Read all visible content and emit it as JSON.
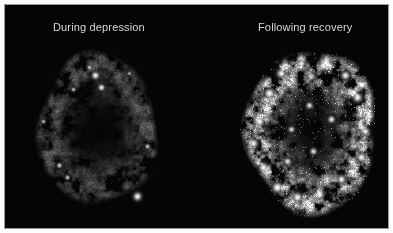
{
  "figure": {
    "type": "brain-scan-comparison",
    "modality": "functional brain scan (PET-style activity map)",
    "background_color": "#050505",
    "frame_color": "#ffffff",
    "border_color": "#9a9a9a",
    "label_color": "#d9d9d9"
  },
  "panels": [
    {
      "id": "during-depression",
      "label": "During depression",
      "label_x": 52,
      "label_y": 20,
      "brain": {
        "center_x": 96,
        "center_y": 128,
        "radius_x": 60,
        "radius_y": 76,
        "intensity": 0.34,
        "hotspot_density": 0.1,
        "seed": 1973,
        "description": "Sparse, dim cortical rim with only a few scattered bright foci; overall low activity."
      },
      "hotspots": [
        {
          "x": 94,
          "y": 74,
          "r": 3.4,
          "v": 0.95
        },
        {
          "x": 88,
          "y": 66,
          "r": 2.2,
          "v": 0.8
        },
        {
          "x": 100,
          "y": 86,
          "r": 3.0,
          "v": 0.92
        },
        {
          "x": 72,
          "y": 88,
          "r": 2.0,
          "v": 0.74
        },
        {
          "x": 136,
          "y": 195,
          "r": 3.6,
          "v": 0.98
        },
        {
          "x": 58,
          "y": 164,
          "r": 2.4,
          "v": 0.8
        },
        {
          "x": 66,
          "y": 176,
          "r": 2.2,
          "v": 0.76
        },
        {
          "x": 146,
          "y": 145,
          "r": 2.2,
          "v": 0.78
        },
        {
          "x": 42,
          "y": 120,
          "r": 2.0,
          "v": 0.7
        },
        {
          "x": 128,
          "y": 72,
          "r": 1.8,
          "v": 0.68
        }
      ]
    },
    {
      "id": "following-recovery",
      "label": "Following recovery",
      "label_x": 257,
      "label_y": 20,
      "brain": {
        "center_x": 310,
        "center_y": 130,
        "radius_x": 66,
        "radius_y": 82,
        "intensity": 1.0,
        "hotspot_density": 0.55,
        "seed": 4421,
        "description": "Dense, bright gyral pattern throughout the cortex with widespread high-uptake foci; markedly increased activity."
      },
      "hotspots": [
        {
          "x": 268,
          "y": 92,
          "r": 4.5,
          "v": 1.0
        },
        {
          "x": 280,
          "y": 72,
          "r": 4.0,
          "v": 0.96
        },
        {
          "x": 300,
          "y": 62,
          "r": 3.6,
          "v": 0.94
        },
        {
          "x": 322,
          "y": 64,
          "r": 4.2,
          "v": 0.98
        },
        {
          "x": 344,
          "y": 74,
          "r": 3.8,
          "v": 0.95
        },
        {
          "x": 356,
          "y": 96,
          "r": 4.0,
          "v": 0.97
        },
        {
          "x": 258,
          "y": 120,
          "r": 4.4,
          "v": 0.99
        },
        {
          "x": 252,
          "y": 142,
          "r": 4.0,
          "v": 0.96
        },
        {
          "x": 262,
          "y": 166,
          "r": 4.2,
          "v": 0.98
        },
        {
          "x": 276,
          "y": 186,
          "r": 4.6,
          "v": 1.0
        },
        {
          "x": 296,
          "y": 196,
          "r": 4.2,
          "v": 0.98
        },
        {
          "x": 318,
          "y": 192,
          "r": 4.0,
          "v": 0.96
        },
        {
          "x": 340,
          "y": 178,
          "r": 3.8,
          "v": 0.95
        },
        {
          "x": 360,
          "y": 156,
          "r": 4.0,
          "v": 0.97
        },
        {
          "x": 364,
          "y": 130,
          "r": 3.6,
          "v": 0.94
        },
        {
          "x": 308,
          "y": 104,
          "r": 3.0,
          "v": 0.88
        },
        {
          "x": 290,
          "y": 128,
          "r": 2.8,
          "v": 0.84
        },
        {
          "x": 330,
          "y": 118,
          "r": 3.2,
          "v": 0.9
        },
        {
          "x": 312,
          "y": 150,
          "r": 3.0,
          "v": 0.88
        },
        {
          "x": 286,
          "y": 160,
          "r": 3.2,
          "v": 0.9
        }
      ]
    }
  ],
  "chart_data": {
    "type": "heatmap",
    "title": "",
    "xlabel": "",
    "ylabel": "",
    "legend": [
      "During depression",
      "Following recovery"
    ],
    "categories": [
      "During depression",
      "Following recovery"
    ],
    "values": [
      0.34,
      1.0
    ],
    "series": [
      {
        "name": "Relative cortical activity",
        "values": [
          0.34,
          1.0
        ]
      }
    ],
    "colormap": "grayscale",
    "grid": false
  }
}
